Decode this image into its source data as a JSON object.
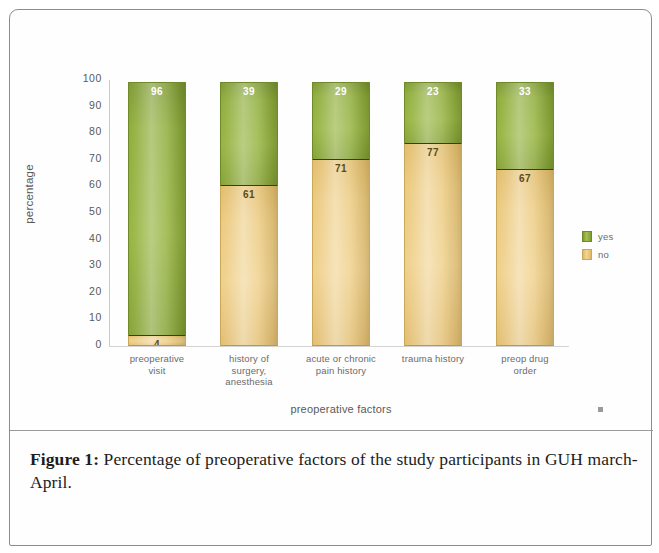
{
  "figure": {
    "caption_label": "Figure 1:",
    "caption_text": " Percentage of preoperative factors of the study participants in GUH march-April."
  },
  "chart_data": {
    "type": "bar",
    "subtype": "stacked-100-percent",
    "title": "",
    "xlabel": "preoperative factors",
    "ylabel": "percentage",
    "ylim": [
      0,
      100
    ],
    "yticks": [
      0,
      10,
      20,
      30,
      40,
      50,
      60,
      70,
      80,
      90,
      100
    ],
    "grid": false,
    "legend_position": "right",
    "categories": [
      "preoperative\nvisit",
      "history of\nsurgery,\nanesthesia",
      "acute or chronic\npain history",
      "trauma history",
      "preop drug\norder"
    ],
    "category_lines": [
      [
        "preoperative",
        "visit"
      ],
      [
        "history of",
        "surgery,",
        "anesthesia"
      ],
      [
        "acute or chronic",
        "pain history"
      ],
      [
        "trauma history"
      ],
      [
        "preop drug",
        "order"
      ]
    ],
    "series": [
      {
        "name": "yes",
        "color": "#8fae3b",
        "values": [
          96,
          39,
          29,
          23,
          33
        ]
      },
      {
        "name": "no",
        "color": "#ecca7e",
        "values": [
          4,
          61,
          71,
          77,
          67
        ]
      }
    ]
  },
  "legend": {
    "items": [
      {
        "label": "yes",
        "swatch": "green-swatch-icon"
      },
      {
        "label": "no",
        "swatch": "tan-swatch-icon"
      }
    ]
  },
  "ticks": {
    "y": [
      "100",
      "90",
      "80",
      "70",
      "60",
      "50",
      "40",
      "30",
      "20",
      "10",
      "0"
    ]
  }
}
